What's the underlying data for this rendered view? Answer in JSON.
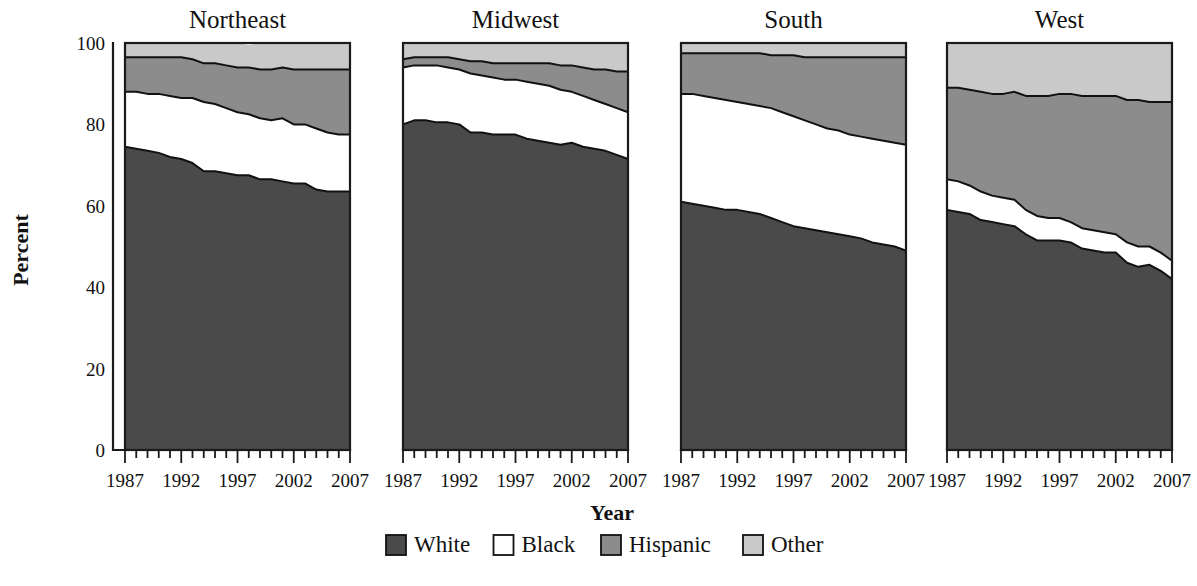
{
  "chart_data": {
    "type": "area",
    "title": "",
    "subtitle": "",
    "xlabel": "Year",
    "ylabel": "Percent",
    "ylim": [
      0,
      100
    ],
    "xlim": [
      1987,
      2007
    ],
    "ytick_labels": [
      "0",
      "20",
      "40",
      "60",
      "80",
      "100"
    ],
    "ytick_values": [
      0,
      20,
      40,
      60,
      80,
      100
    ],
    "xtick_labels": [
      "1987",
      "1992",
      "1997",
      "2002",
      "2007"
    ],
    "xtick_values": [
      1987,
      1992,
      1997,
      2002,
      2007
    ],
    "minor_xticks": [
      1987,
      1988,
      1989,
      1990,
      1991,
      1992,
      1993,
      1994,
      1995,
      1996,
      1997,
      1998,
      1999,
      2000,
      2001,
      2002,
      2003,
      2004,
      2005,
      2006,
      2007
    ],
    "grid": false,
    "stacked": true,
    "legend_position": "bottom",
    "legend": [
      {
        "name": "White",
        "color": "#4a4a4a"
      },
      {
        "name": "Black",
        "color": "#ffffff"
      },
      {
        "name": "Hispanic",
        "color": "#8c8c8c"
      },
      {
        "name": "Other",
        "color": "#c9c9c9"
      }
    ],
    "x": [
      1987,
      1988,
      1989,
      1990,
      1991,
      1992,
      1993,
      1994,
      1995,
      1996,
      1997,
      1998,
      1999,
      2000,
      2001,
      2002,
      2003,
      2004,
      2005,
      2006,
      2007
    ],
    "panels": [
      {
        "title": "Northeast",
        "series": [
          {
            "name": "White",
            "values": [
              74.5,
              74.0,
              73.5,
              73.0,
              72.0,
              71.5,
              70.5,
              68.5,
              68.5,
              68.0,
              67.5,
              67.5,
              66.5,
              66.5,
              66.0,
              65.5,
              65.5,
              64.0,
              63.5,
              63.5,
              63.5
            ]
          },
          {
            "name": "Black",
            "values": [
              13.5,
              14.0,
              14.0,
              14.5,
              15.0,
              15.0,
              16.0,
              17.0,
              16.5,
              16.0,
              15.5,
              15.0,
              15.0,
              14.5,
              15.5,
              14.5,
              14.5,
              15.0,
              14.5,
              14.0,
              14.0
            ]
          },
          {
            "name": "Hispanic",
            "values": [
              8.5,
              8.5,
              9.0,
              9.0,
              9.5,
              10.0,
              9.5,
              9.5,
              10.0,
              10.5,
              11.0,
              11.5,
              12.0,
              12.5,
              12.5,
              13.5,
              13.5,
              14.5,
              15.5,
              16.0,
              16.0
            ]
          },
          {
            "name": "Other",
            "values": [
              3.5,
              3.5,
              3.5,
              3.5,
              3.5,
              3.5,
              4.0,
              5.0,
              5.0,
              5.5,
              6.0,
              5.5,
              6.5,
              6.5,
              6.0,
              6.5,
              6.5,
              6.5,
              6.5,
              6.5,
              6.5
            ]
          }
        ]
      },
      {
        "title": "Midwest",
        "series": [
          {
            "name": "White",
            "values": [
              80.0,
              81.0,
              81.0,
              80.5,
              80.5,
              80.0,
              78.0,
              78.0,
              77.5,
              77.5,
              77.5,
              76.5,
              76.0,
              75.5,
              75.0,
              75.5,
              74.5,
              74.0,
              73.5,
              72.5,
              71.5
            ]
          },
          {
            "name": "Black",
            "values": [
              14.0,
              13.5,
              13.5,
              14.0,
              13.5,
              13.5,
              14.5,
              14.0,
              14.0,
              13.5,
              13.5,
              14.0,
              14.0,
              14.0,
              13.5,
              12.5,
              12.5,
              12.0,
              11.5,
              11.5,
              11.5
            ]
          },
          {
            "name": "Hispanic",
            "values": [
              2.0,
              2.0,
              2.0,
              2.0,
              2.5,
              2.5,
              3.0,
              3.5,
              3.5,
              4.0,
              4.0,
              4.5,
              5.0,
              5.5,
              6.0,
              6.5,
              7.0,
              7.5,
              8.5,
              9.0,
              10.0
            ]
          },
          {
            "name": "Other",
            "values": [
              4.0,
              3.5,
              3.5,
              3.5,
              3.5,
              4.0,
              4.5,
              4.5,
              5.0,
              5.0,
              5.0,
              5.0,
              5.0,
              5.0,
              5.5,
              5.5,
              6.0,
              6.5,
              6.5,
              7.0,
              7.0
            ]
          }
        ]
      },
      {
        "title": "South",
        "series": [
          {
            "name": "White",
            "values": [
              61.0,
              60.5,
              60.0,
              59.5,
              59.0,
              59.0,
              58.5,
              58.0,
              57.0,
              56.0,
              55.0,
              54.5,
              54.0,
              53.5,
              53.0,
              52.5,
              52.0,
              51.0,
              50.5,
              50.0,
              49.0
            ]
          },
          {
            "name": "Black",
            "values": [
              26.5,
              27.0,
              27.0,
              27.0,
              27.0,
              26.5,
              26.5,
              26.5,
              27.0,
              27.0,
              27.0,
              26.5,
              26.0,
              25.5,
              25.5,
              25.0,
              25.0,
              25.5,
              25.5,
              25.5,
              26.0
            ]
          },
          {
            "name": "Hispanic",
            "values": [
              10.0,
              10.0,
              10.5,
              11.0,
              11.5,
              12.0,
              12.5,
              13.0,
              13.0,
              14.0,
              15.0,
              15.5,
              16.5,
              17.5,
              18.0,
              19.0,
              19.5,
              20.0,
              20.5,
              21.0,
              21.5
            ]
          },
          {
            "name": "Other",
            "values": [
              2.5,
              2.5,
              2.5,
              2.5,
              2.5,
              2.5,
              2.5,
              2.5,
              3.0,
              3.0,
              3.0,
              3.5,
              3.5,
              3.5,
              3.5,
              3.5,
              3.5,
              3.5,
              3.5,
              3.5,
              3.5
            ]
          }
        ]
      },
      {
        "title": "West",
        "series": [
          {
            "name": "White",
            "values": [
              59.0,
              58.5,
              58.0,
              56.5,
              56.0,
              55.5,
              55.0,
              53.0,
              51.5,
              51.5,
              51.5,
              51.0,
              49.5,
              49.0,
              48.5,
              48.5,
              46.0,
              45.0,
              45.5,
              44.0,
              42.0
            ]
          },
          {
            "name": "Black",
            "values": [
              7.5,
              7.5,
              7.0,
              7.0,
              6.5,
              6.5,
              6.5,
              6.0,
              6.0,
              5.5,
              5.5,
              5.0,
              5.0,
              5.0,
              5.0,
              4.5,
              5.0,
              5.0,
              4.5,
              4.5,
              4.5
            ]
          },
          {
            "name": "Hispanic",
            "values": [
              22.5,
              23.0,
              23.5,
              24.5,
              25.0,
              25.5,
              26.5,
              28.0,
              29.5,
              30.0,
              30.5,
              31.5,
              32.5,
              33.0,
              33.5,
              34.0,
              35.0,
              36.0,
              35.5,
              37.0,
              39.0
            ]
          },
          {
            "name": "Other",
            "values": [
              11.0,
              11.0,
              11.5,
              12.0,
              12.5,
              12.5,
              12.0,
              13.0,
              13.0,
              13.0,
              12.5,
              12.5,
              13.0,
              13.0,
              13.0,
              13.0,
              14.0,
              14.0,
              14.5,
              14.5,
              14.5
            ]
          }
        ]
      }
    ]
  }
}
